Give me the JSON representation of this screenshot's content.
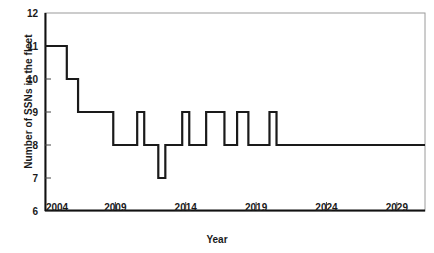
{
  "chart_data": {
    "type": "line",
    "title": "",
    "subtitle": "",
    "xlabel": "Year",
    "ylabel": "Number of SSNs in the fleet",
    "xlim": [
      2004,
      2031
    ],
    "ylim": [
      6,
      12
    ],
    "xticks": [
      2004,
      2009,
      2014,
      2019,
      2024,
      2029
    ],
    "xtick_labels": [
      "2004",
      "2009",
      "2014",
      "2019",
      "2024",
      "2029"
    ],
    "yticks": [
      6,
      7,
      8,
      9,
      10,
      11,
      12
    ],
    "ytick_labels": [
      "6",
      "7",
      "8",
      "9",
      "10",
      "11",
      "12"
    ],
    "grid": false,
    "legend": null,
    "legend_position": "none",
    "line_color": "#1a1a1a",
    "line_width": 2.2,
    "step_style": "post",
    "annotations": [],
    "series": [
      {
        "name": "SSNs in the fleet",
        "x": [
          2004.0,
          2005.55,
          2005.55,
          2006.35,
          2006.35,
          2006.95,
          2006.95,
          2008.85,
          2008.85,
          2010.55,
          2010.55,
          2011.05,
          2011.05,
          2012.05,
          2012.05,
          2012.55,
          2012.55,
          2013.05,
          2013.05,
          2013.75,
          2013.75,
          2014.25,
          2014.25,
          2015.45,
          2015.45,
          2016.75,
          2016.75,
          2017.65,
          2017.65,
          2018.45,
          2018.45,
          2019.95,
          2019.95,
          2020.45,
          2020.45,
          2031.0
        ],
        "y": [
          11,
          11,
          10,
          10,
          9,
          9,
          9,
          9,
          8,
          8,
          9,
          9,
          8,
          8,
          7,
          7,
          8,
          8,
          8,
          8,
          9,
          9,
          8,
          8,
          9,
          9,
          8,
          8,
          9,
          9,
          8,
          8,
          9,
          9,
          8,
          8
        ]
      }
    ],
    "data_points_readable": [
      {
        "year": 2004,
        "value": 11
      },
      {
        "year": 2005,
        "value": 11
      },
      {
        "year": 2006,
        "value": 10
      },
      {
        "year": 2007,
        "value": 9
      },
      {
        "year": 2008,
        "value": 9
      },
      {
        "year": 2009,
        "value": 8
      },
      {
        "year": 2010,
        "value": 8
      },
      {
        "year": 2011,
        "value": 9
      },
      {
        "year": 2012,
        "value": 8
      },
      {
        "year": 2013,
        "value": 7
      },
      {
        "year": 2014,
        "value": 9
      },
      {
        "year": 2015,
        "value": 8
      },
      {
        "year": 2016,
        "value": 9
      },
      {
        "year": 2017,
        "value": 8
      },
      {
        "year": 2018,
        "value": 9
      },
      {
        "year": 2019,
        "value": 8
      },
      {
        "year": 2020,
        "value": 9
      },
      {
        "year": 2021,
        "value": 8
      },
      {
        "year": 2022,
        "value": 8
      },
      {
        "year": 2023,
        "value": 8
      },
      {
        "year": 2024,
        "value": 8
      },
      {
        "year": 2025,
        "value": 8
      },
      {
        "year": 2026,
        "value": 8
      },
      {
        "year": 2027,
        "value": 8
      },
      {
        "year": 2028,
        "value": 8
      },
      {
        "year": 2029,
        "value": 8
      },
      {
        "year": 2030,
        "value": 8
      },
      {
        "year": 2031,
        "value": 8
      }
    ]
  },
  "colors": {
    "line": "#1a1a1a",
    "axis": "#111111",
    "frame": "#9a9a9a",
    "background": "#ffffff",
    "text": "#1a1a1a"
  }
}
